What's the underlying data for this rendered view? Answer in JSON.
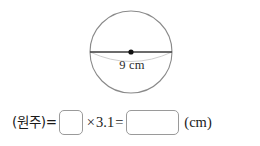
{
  "figure": {
    "shape_name": "circle",
    "diameter_label": "9 cm",
    "diameter_value": 9,
    "diameter_unit": "cm",
    "center_dot_name": "center-point",
    "arc_name": "lower-arc"
  },
  "equation": {
    "term_label": "(원주)=",
    "operator_times": "×",
    "multiplier": "3.1",
    "operator_equals": "=",
    "unit": "(cm)",
    "blank_diameter_value": "",
    "blank_result_value": ""
  },
  "colors": {
    "circle_stroke": "#8a8a8a",
    "diameter_stroke": "#3a3a3a",
    "arc_stroke": "#c9c9c9",
    "box_border": "#9a9a9a",
    "text": "#1a1a1a",
    "background": "#ffffff"
  }
}
